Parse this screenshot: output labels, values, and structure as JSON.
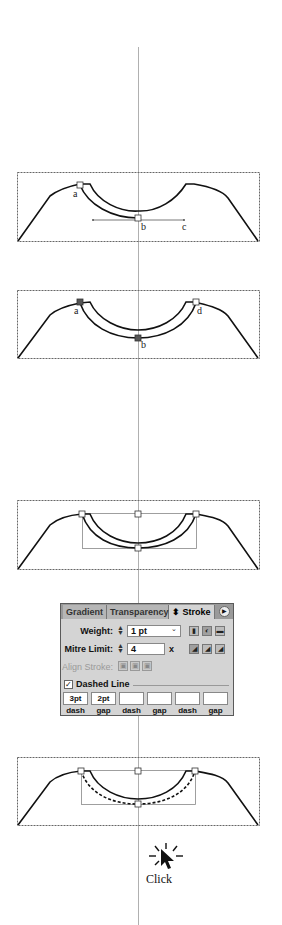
{
  "figure": {
    "step1": {
      "labels": {
        "a": "a",
        "b": "b",
        "c": "c"
      }
    },
    "step2": {
      "labels": {
        "a": "a",
        "b": "b",
        "d": "d"
      }
    },
    "step5": {
      "caption": "Click"
    }
  },
  "stroke_panel": {
    "tabs": [
      {
        "label": "Gradient",
        "active": false
      },
      {
        "label": "Transparency",
        "active": false
      },
      {
        "label": "⬍ Stroke",
        "active": true
      }
    ],
    "menu_icon": "panel-menu-icon",
    "weight": {
      "label": "Weight:",
      "value": "1 pt"
    },
    "mitre_limit": {
      "label": "Mitre Limit:",
      "value": "4",
      "unit": "x"
    },
    "align_stroke": {
      "label": "Align Stroke:"
    },
    "cap_buttons": [
      "butt-cap-icon",
      "round-cap-icon",
      "projecting-cap-icon"
    ],
    "join_buttons": [
      "miter-join-icon",
      "round-join-icon",
      "bevel-join-icon"
    ],
    "align_buttons": [
      "align-center-icon",
      "align-inside-icon",
      "align-outside-icon"
    ],
    "dashed_line": {
      "label": "Dashed Line",
      "checked": true,
      "fields": [
        {
          "value": "3pt",
          "caption": "dash"
        },
        {
          "value": "2pt",
          "caption": "gap"
        },
        {
          "value": "",
          "caption": "dash"
        },
        {
          "value": "",
          "caption": "gap"
        },
        {
          "value": "",
          "caption": "dash"
        },
        {
          "value": "",
          "caption": "gap"
        }
      ]
    }
  },
  "colors": {
    "stroke": "#111111",
    "guide": "#aaaaaa",
    "anchor_selected": "#555555",
    "panel_bg": "#d4d4d4"
  }
}
